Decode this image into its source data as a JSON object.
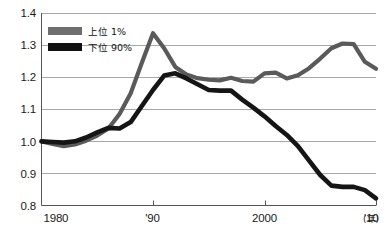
{
  "chart_data": {
    "type": "line",
    "title": "",
    "subtitle": "",
    "xlabel": "(年)",
    "ylabel": "",
    "xlim": [
      1980,
      2010
    ],
    "ylim": [
      0.8,
      1.4
    ],
    "grid": true,
    "grid_axis": "y",
    "legend_position": "top-left",
    "x_tick_labels": [
      "1980",
      "'90",
      "2000",
      "'10"
    ],
    "x_tick_values": [
      1980,
      1990,
      2000,
      2010
    ],
    "y_tick_labels": [
      "0.8",
      "0.9",
      "1.0",
      "1.1",
      "1.2",
      "1.3",
      "1.4"
    ],
    "y_tick_values": [
      0.8,
      0.9,
      1.0,
      1.1,
      1.2,
      1.3,
      1.4
    ],
    "x": [
      1980,
      1981,
      1982,
      1983,
      1984,
      1985,
      1986,
      1987,
      1988,
      1989,
      1990,
      1991,
      1992,
      1993,
      1994,
      1995,
      1996,
      1997,
      1998,
      1999,
      2000,
      2001,
      2002,
      2003,
      2004,
      2005,
      2006,
      2007,
      2008,
      2009,
      2010
    ],
    "series": [
      {
        "name": "上位 1%",
        "color": "#5a5a5a",
        "width": 4.2,
        "values": [
          1.0,
          0.992,
          0.985,
          0.99,
          1.002,
          1.018,
          1.04,
          1.085,
          1.15,
          1.245,
          1.337,
          1.29,
          1.232,
          1.208,
          1.197,
          1.192,
          1.19,
          1.198,
          1.188,
          1.186,
          1.212,
          1.214,
          1.196,
          1.206,
          1.228,
          1.258,
          1.29,
          1.305,
          1.303,
          1.248,
          1.226
        ]
      },
      {
        "name": "下位 90%",
        "color": "#151515",
        "width": 4.6,
        "values": [
          1.0,
          0.998,
          0.996,
          1.0,
          1.012,
          1.028,
          1.042,
          1.04,
          1.06,
          1.11,
          1.16,
          1.205,
          1.212,
          1.196,
          1.178,
          1.16,
          1.158,
          1.158,
          1.13,
          1.105,
          1.078,
          1.048,
          1.02,
          0.985,
          0.94,
          0.895,
          0.862,
          0.858,
          0.858,
          0.848,
          0.822
        ]
      }
    ]
  },
  "legend": {
    "items": [
      {
        "label": "上位 1%",
        "swatch_color": "#6e6e6e"
      },
      {
        "label": "下位 90%",
        "swatch_color": "#101010"
      }
    ]
  },
  "axis": {
    "unit_suffix": "(年)"
  },
  "colors": {
    "background": "#ffffff",
    "axis": "#555555",
    "grid": "#a8a8a8",
    "text": "#1a1a1a",
    "top1_line": "#5a5a5a",
    "bottom90_line": "#151515"
  }
}
